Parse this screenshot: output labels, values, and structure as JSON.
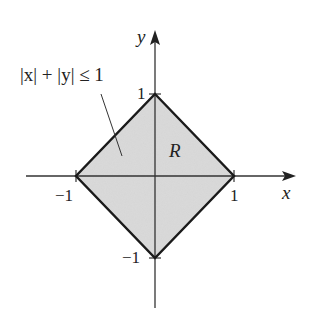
{
  "diagram": {
    "title": "",
    "axes": {
      "x_label": "x",
      "y_label": "y"
    },
    "ticks": {
      "x_pos": "1",
      "x_neg": "−1",
      "y_pos": "1",
      "y_neg": "−1"
    },
    "region": {
      "label": "R",
      "inequality": "|x| + |y| ≤ 1",
      "vertices": [
        [
          1,
          0
        ],
        [
          0,
          1
        ],
        [
          -1,
          0
        ],
        [
          0,
          -1
        ]
      ],
      "fill_color": "#d9d9d9",
      "edge_color": "#1a1a1a"
    }
  }
}
